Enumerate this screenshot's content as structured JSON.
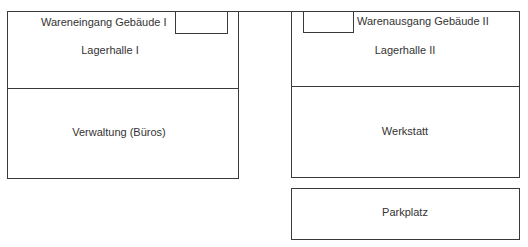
{
  "diagram": {
    "type": "floor-plan",
    "buildings": [
      {
        "id": "gebaeude-1",
        "entrance_label": "Wareneingang Gebäude I",
        "upper_room": "Lagerhalle I",
        "lower_room": "Verwaltung (Büros)"
      },
      {
        "id": "gebaeude-2",
        "exit_label": "Warenausgang Gebäude II",
        "upper_room": "Lagerhalle II",
        "lower_room": "Werkstatt"
      }
    ],
    "parking": {
      "label": "Parkplatz"
    },
    "colors": {
      "line": "#3a3a3a",
      "text": "#333333",
      "background": "#ffffff"
    }
  }
}
